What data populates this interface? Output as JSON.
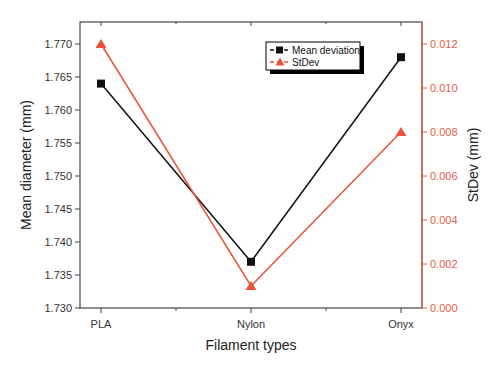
{
  "chart_data": {
    "type": "line",
    "title": "",
    "xlabel": "Filament types",
    "ylabel": "Mean diameter (mm)",
    "y2label": "StDev (mm)",
    "categories": [
      "PLA",
      "Nylon",
      "Onyx"
    ],
    "series": [
      {
        "name": "Mean deviation",
        "axis": "left",
        "marker": "square",
        "color": "#111111",
        "values": [
          1.764,
          1.737,
          1.768
        ]
      },
      {
        "name": "StDev",
        "axis": "right",
        "marker": "triangle",
        "color": "#e8553a",
        "values": [
          0.012,
          0.001,
          0.008
        ]
      }
    ],
    "ylim": [
      1.73,
      1.772
    ],
    "y2lim": [
      0.0,
      0.0124
    ],
    "yticks": [
      "1.730",
      "1.735",
      "1.740",
      "1.745",
      "1.750",
      "1.755",
      "1.760",
      "1.765",
      "1.770"
    ],
    "y2ticks": [
      "0.000",
      "0.002",
      "0.004",
      "0.006",
      "0.008",
      "0.010",
      "0.012"
    ],
    "grid": false,
    "legend_position": "upper center-right"
  },
  "legend": {
    "items": [
      {
        "label": "Mean deviation"
      },
      {
        "label": "StDev"
      }
    ]
  }
}
